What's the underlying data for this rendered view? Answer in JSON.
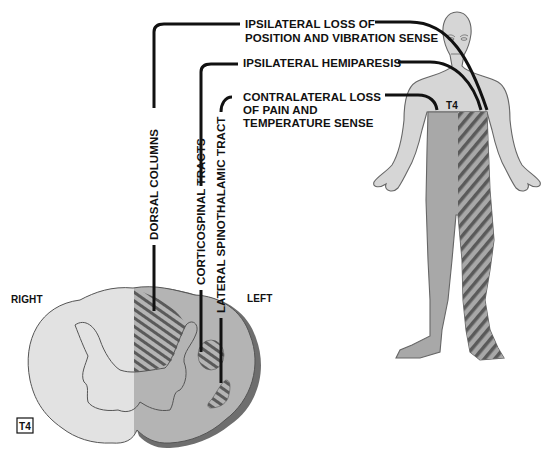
{
  "diagram": {
    "colors": {
      "background": "#ffffff",
      "cord_right": "#e2e2e2",
      "cord_left": "#b4b4b4",
      "cord_rim": "#6e6e6e",
      "body_skin": "#d6d6d6",
      "body_affected": "#a8a8a8",
      "hatch": "#5a5a5a",
      "outline": "#555555",
      "leader_line": "#111111"
    },
    "labels": {
      "ipsi_position": [
        "IPSILATERAL LOSS OF",
        "POSITION AND VIBRATION SENSE"
      ],
      "ipsi_hemiparesis": "IPSILATERAL HEMIPARESIS",
      "contra_pain": [
        "CONTRALATERAL LOSS",
        "OF PAIN AND",
        "TEMPERATURE SENSE"
      ],
      "dorsal_columns": "DORSAL COLUMNS",
      "corticospinal": "CORTICOSPINAL TRACTS",
      "spinothalamic": "LATERAL SPINOTHALAMIC TRACT",
      "right": "RIGHT",
      "left": "LEFT",
      "level_cord": "T4",
      "level_body": "T4"
    }
  }
}
